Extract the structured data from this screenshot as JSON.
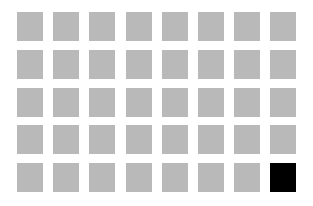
{
  "grid": {
    "rows": 5,
    "columns": 8,
    "default_color": "#b9b9b9",
    "highlight_color": "#000000",
    "highlighted_cells": [
      {
        "row": 5,
        "column": 8
      }
    ],
    "background_color": "#ffffff"
  }
}
